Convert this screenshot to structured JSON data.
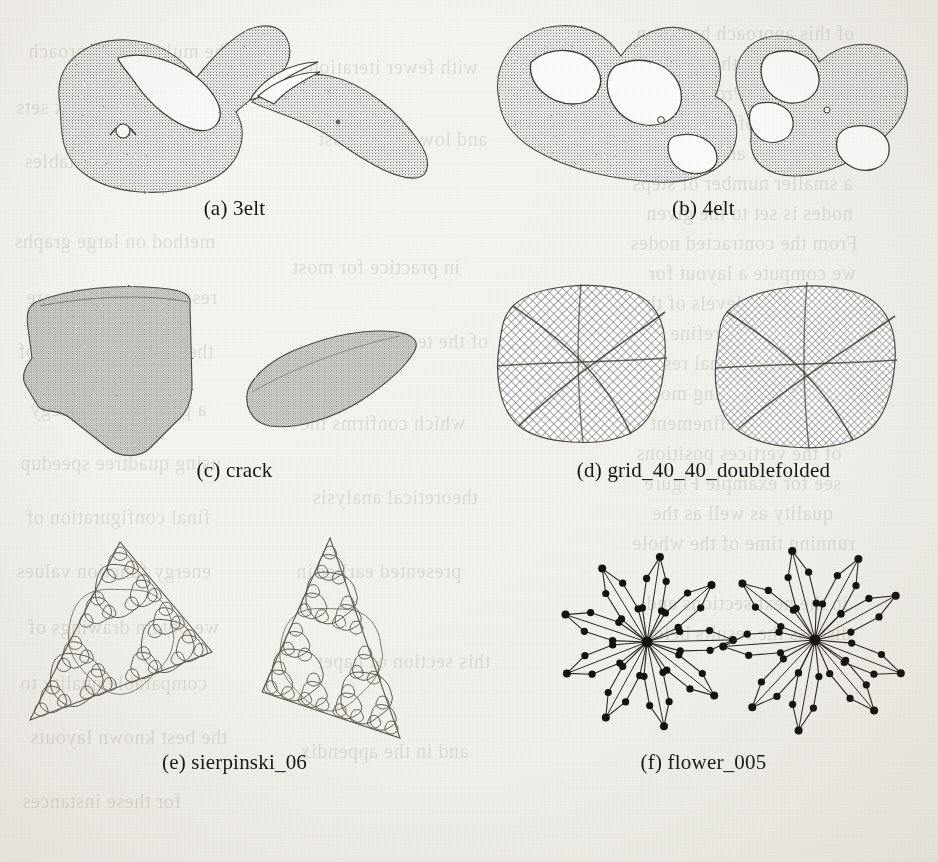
{
  "figure": {
    "background_color": "#f2f0eb",
    "ink_color": "#3a3731",
    "page_kind": "scanned-paper-figure",
    "subfigures": [
      {
        "id": "a",
        "label": "(a)",
        "name": "3elt",
        "caption": "(a) 3elt",
        "views": [
          "initial-layout",
          "folded-layout"
        ],
        "render": "point-cloud-mesh"
      },
      {
        "id": "b",
        "label": "(b)",
        "name": "4elt",
        "caption": "(b) 4elt",
        "views": [
          "initial-layout",
          "folded-layout"
        ],
        "render": "point-cloud-mesh"
      },
      {
        "id": "c",
        "label": "(c)",
        "name": "crack",
        "caption": "(c) crack",
        "views": [
          "initial-layout",
          "folded-layout"
        ],
        "render": "point-cloud-mesh"
      },
      {
        "id": "d",
        "label": "(d)",
        "name": "grid_40_40_doublefolded",
        "caption": "(d) grid_40_40_doublefolded",
        "views": [
          "initial-layout",
          "folded-layout"
        ],
        "render": "wireframe-grid"
      },
      {
        "id": "e",
        "label": "(e)",
        "name": "sierpinski_06",
        "caption": "(e) sierpinski_06",
        "views": [
          "initial-layout",
          "folded-layout"
        ],
        "render": "circle-packing-fractal"
      },
      {
        "id": "f",
        "label": "(f)",
        "name": "flower_005",
        "caption": "(f) flower_005",
        "views": [
          "initial-layout",
          "folded-layout"
        ],
        "render": "node-link-flower"
      }
    ]
  },
  "chart_data": {
    "type": "scatter",
    "xlabel": "",
    "ylabel": "",
    "grid": false,
    "legend": null,
    "panels": [
      {
        "key": "a",
        "label": "3elt",
        "views": 2,
        "style": "dense point mesh, teardrop silhouette with one large loop/hole"
      },
      {
        "key": "b",
        "label": "4elt",
        "views": 2,
        "style": "dense point mesh, several loops and holes"
      },
      {
        "key": "c",
        "label": "crack",
        "views": 2,
        "style": "dense point mesh, irregular polygonal sheet"
      },
      {
        "key": "d",
        "label": "grid_40_40_doublefolded",
        "views": 2,
        "style": "40x40 quad wireframe grid folded along two diagonals"
      },
      {
        "key": "e",
        "label": "sierpinski_06",
        "views": 2,
        "style": "order-6 sierpinski circle packing inside a triangle"
      },
      {
        "key": "f",
        "label": "flower_005",
        "views": 2,
        "style": "radial flower graph, 9 petals of node chains around a hub"
      }
    ]
  },
  "bleed_text": [
    {
      "t": "of this approach has been",
      "x": 636,
      "y": 22
    },
    {
      "t": "and 1966 that the energy",
      "x": 648,
      "y": 52
    },
    {
      "t": "published in Proceedings",
      "x": 640,
      "y": 82
    },
    {
      "t": "the number of crossings in",
      "x": 630,
      "y": 112
    },
    {
      "t": "minimal cut and the size",
      "x": 644,
      "y": 142
    },
    {
      "t": "a smaller number of steps",
      "x": 632,
      "y": 172
    },
    {
      "t": "nodes is set to the given",
      "x": 646,
      "y": 202
    },
    {
      "t": "From the contracted nodes",
      "x": 630,
      "y": 232
    },
    {
      "t": "we compute a layout for",
      "x": 648,
      "y": 262
    },
    {
      "t": "the coarser levels of the",
      "x": 636,
      "y": 292
    },
    {
      "t": "graph and then refine it",
      "x": 652,
      "y": 322
    },
    {
      "t": "to obtain the final result",
      "x": 640,
      "y": 352
    },
    {
      "t": "we use the spring model",
      "x": 634,
      "y": 382
    },
    {
      "t": "for the local refinement",
      "x": 650,
      "y": 412
    },
    {
      "t": "of the vertices positions",
      "x": 636,
      "y": 442
    },
    {
      "t": "see for example Figure",
      "x": 644,
      "y": 472
    },
    {
      "t": "quality as well as the",
      "x": 652,
      "y": 502
    },
    {
      "t": "running time of the whole",
      "x": 632,
      "y": 532
    },
    {
      "t": "in the next sections and",
      "x": 646,
      "y": 592
    },
    {
      "t": "discuss the results below",
      "x": 638,
      "y": 622
    },
    {
      "t": "he multilevel approach",
      "x": 28,
      "y": 40
    },
    {
      "t": "several benchmark sets",
      "x": 16,
      "y": 96
    },
    {
      "t": "are shown in the tables",
      "x": 24,
      "y": 150
    },
    {
      "t": "method on large graphs",
      "x": 14,
      "y": 230
    },
    {
      "t": "resulting drawings are",
      "x": 26,
      "y": 286
    },
    {
      "t": "the local refinement of",
      "x": 18,
      "y": 340
    },
    {
      "t": "a placement strategy",
      "x": 30,
      "y": 398
    },
    {
      "t": "using quadtree speedup",
      "x": 20,
      "y": 452
    },
    {
      "t": "final configuration of",
      "x": 26,
      "y": 506
    },
    {
      "t": "energy function values",
      "x": 16,
      "y": 560
    },
    {
      "t": "we obtain drawings of",
      "x": 28,
      "y": 616
    },
    {
      "t": "comparable quality to",
      "x": 20,
      "y": 672
    },
    {
      "t": "the best known layouts",
      "x": 30,
      "y": 726
    },
    {
      "t": "for these instances",
      "x": 22,
      "y": 790
    },
    {
      "t": "with fewer iterations",
      "x": 300,
      "y": 56
    },
    {
      "t": "and lower total cost",
      "x": 318,
      "y": 128
    },
    {
      "t": "in practice for most",
      "x": 292,
      "y": 256
    },
    {
      "t": "of the tested graphs",
      "x": 320,
      "y": 330
    },
    {
      "t": "which confirms the",
      "x": 300,
      "y": 412
    },
    {
      "t": "theoretical analysis",
      "x": 312,
      "y": 486
    },
    {
      "t": "presented earlier in",
      "x": 296,
      "y": 560
    },
    {
      "t": "this section of paper",
      "x": 316,
      "y": 650
    },
    {
      "t": "and in the appendix",
      "x": 300,
      "y": 740
    }
  ]
}
